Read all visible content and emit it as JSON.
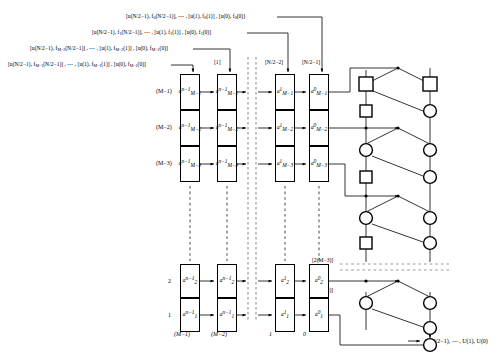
{
  "diagram": {
    "input_streams": [
      "[u(N/2−1), f₀(N/2−1)], ⋯ , [u(1), f₀(1)] , [u(0), f₀(0)]",
      "[u(N/2−1), f₁(N/2−1)], ⋯ , [u(1), f₁(1)] , [u(0), f₁(0)]",
      "[u(N/2−1), f_{M−2}(N/2−1)] , ⋯ , [u(1), f_{M−2}(1)] , [u(0), f_{M−2}(0)]",
      "[u(N/2−1), f_{M−1}(N/2−1)] , ⋯ , [u(1), f_{M−1}(1)] , [u(0), f_{M−1}(0)]"
    ],
    "input_stream_parts": [
      {
        "prefix": "[u(N/2−1), f",
        "idx": "0",
        "mid": "(N/2−1)], ⋯ , [u(1), f",
        "idx2": "0",
        "mid2": "(1)] , [u(0), f",
        "idx3": "0",
        "suffix": "(0)]"
      },
      {
        "prefix": "[u(N/2−1), f",
        "idx": "1",
        "mid": "(N/2−1)], ⋯ , [u(1), f",
        "idx2": "1",
        "mid2": "(1)] , [u(0), f",
        "idx3": "1",
        "suffix": "(0)]"
      },
      {
        "prefix": "[u(N/2−1), f",
        "idx": "M−2",
        "mid": "(N/2−1)] , ⋯ , [u(1), f",
        "idx2": "M−2",
        "mid2": "(1)] , [u(0), f",
        "idx3": "M−2",
        "suffix": "(0)]"
      },
      {
        "prefix": "[u(N/2−1), f",
        "idx": "M−1",
        "mid": "(N/2−1)] , ⋯ , [u(1), f",
        "idx2": "M−1",
        "mid2": "(1)] , [u(0), f",
        "idx3": "M−1",
        "suffix": "(0)]"
      }
    ],
    "top_tags": [
      "[1]",
      "[N/2−2]",
      "[N/2−1]"
    ],
    "right_tags": [
      "[2]",
      "[4]"
    ],
    "lower_right_tags": [
      "[2(M−3)]",
      "[2(M−2)]"
    ],
    "column_labels_top": [
      "(M−1)",
      "(M−2)"
    ],
    "column_labels_bottom": [
      "(M−1)",
      "(M−2)",
      "1",
      "0"
    ],
    "row_labels_top": [
      "(M−1)",
      "(M−2)",
      "(M−3)"
    ],
    "row_labels_bottom": [
      "2",
      "1"
    ],
    "output_label": "U(N/2−1), ⋯ , U(1), U(0)",
    "cells": {
      "top_stage_left": [
        {
          "base": "a",
          "sup": "n−1",
          "sub": "M−1"
        },
        {
          "base": "a",
          "sup": "n−1",
          "sub": "M−2"
        },
        {
          "base": "a",
          "sup": "n−1",
          "sub": "M−3"
        }
      ],
      "top_stage_right": [
        {
          "base": "a",
          "sup": "1",
          "sub": "M−1"
        },
        {
          "base": "a",
          "sup": "1",
          "sub": "M−2"
        },
        {
          "base": "a",
          "sup": "1",
          "sub": "M−3"
        }
      ],
      "top_stage_last": [
        {
          "base": "a",
          "sup": "0",
          "sub": "M−1"
        },
        {
          "base": "a",
          "sup": "0",
          "sub": "M−2"
        },
        {
          "base": "a",
          "sup": "0",
          "sub": "M−3"
        }
      ],
      "bottom_stage_left": [
        {
          "base": "a",
          "sup": "n−1",
          "sub": "2"
        },
        {
          "base": "a",
          "sup": "n−1",
          "sub": "1"
        }
      ],
      "bottom_stage_right": [
        {
          "base": "a",
          "sup": "1",
          "sub": "2"
        },
        {
          "base": "a",
          "sup": "1",
          "sub": "1"
        }
      ],
      "bottom_stage_last": [
        {
          "base": "a",
          "sup": "0",
          "sub": "2"
        },
        {
          "base": "a",
          "sup": "0",
          "sub": "1"
        }
      ]
    },
    "node_shapes": {
      "square": "square-node",
      "circle": "circle-node"
    },
    "colors": {
      "line": "#000000",
      "dashed": "#9a9a9a",
      "background": "#ffffff"
    }
  }
}
